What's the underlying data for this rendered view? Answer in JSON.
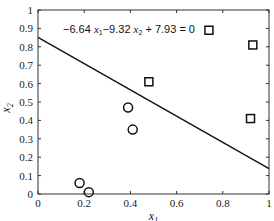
{
  "chart_data": {
    "type": "scatter",
    "title": "",
    "xlabel": "x1",
    "ylabel": "x2",
    "xlim": [
      0,
      1
    ],
    "ylim": [
      0,
      1
    ],
    "x_ticks": [
      "0",
      "0.2",
      "0.4",
      "0.6",
      "0.8",
      "1"
    ],
    "y_ticks": [
      "0",
      "0.1",
      "0.2",
      "0.3",
      "0.4",
      "0.5",
      "0.6",
      "0.7",
      "0.8",
      "0.9",
      "1"
    ],
    "grid": false,
    "series": [
      {
        "name": "class-circle",
        "marker": "circle",
        "points": [
          [
            0.18,
            0.06
          ],
          [
            0.22,
            0.01
          ],
          [
            0.39,
            0.47
          ],
          [
            0.41,
            0.35
          ]
        ]
      },
      {
        "name": "class-square",
        "marker": "square",
        "points": [
          [
            0.48,
            0.61
          ],
          [
            0.74,
            0.89
          ],
          [
            0.93,
            0.81
          ],
          [
            0.92,
            0.41
          ]
        ]
      }
    ],
    "decision_boundary": {
      "equation": "−6.64 x1−9.32 x2 + 7.93 = 0",
      "w1": -6.64,
      "w2": -9.32,
      "b": 7.93
    },
    "annotation": "−6.64 x₁−9.32 x₂ + 7.93 = 0"
  }
}
